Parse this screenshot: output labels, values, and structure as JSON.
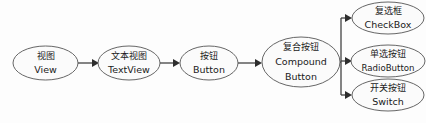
{
  "diagram": {
    "type": "flowchart",
    "background_color": "#fdfdfd",
    "node_fill_color": "#fbfbfb",
    "node_stroke_color": "#555555",
    "edge_color": "#3c3c3c",
    "nodes": [
      {
        "id": "view",
        "label_cn": "视图",
        "label_en": "View",
        "cx": 45.5,
        "cy": 63,
        "rx": 32.5,
        "ry": 17
      },
      {
        "id": "textview",
        "label_cn": "文本视图",
        "label_en": "TextView",
        "cx": 129,
        "cy": 63,
        "rx": 31,
        "ry": 17
      },
      {
        "id": "button",
        "label_cn": "按钮",
        "label_en": "Button",
        "cx": 209,
        "cy": 63,
        "rx": 29,
        "ry": 17
      },
      {
        "id": "compoundbutton",
        "label_cn": "复合按钮",
        "label_en_line1": "Compound",
        "label_en_line2": "Button",
        "cx": 301,
        "cy": 62,
        "rx": 39,
        "ry": 25
      },
      {
        "id": "checkbox",
        "label_cn": "复选框",
        "label_en": "CheckBox",
        "cx": 388,
        "cy": 18,
        "rx": 36,
        "ry": 16
      },
      {
        "id": "radiobutton",
        "label_cn": "单选按钮",
        "label_en": "RadioButton",
        "cx": 388,
        "cy": 61,
        "rx": 37,
        "ry": 16
      },
      {
        "id": "switch",
        "label_cn": "开关按钮",
        "label_en": "Switch",
        "cx": 388,
        "cy": 95,
        "rx": 36,
        "ry": 16
      }
    ],
    "edges": [
      {
        "id": "view-to-textview",
        "from": "view",
        "to": "textview",
        "kind": "straight-arrow"
      },
      {
        "id": "textview-to-button",
        "from": "textview",
        "to": "button",
        "kind": "straight-arrow"
      },
      {
        "id": "button-to-compoundbutton",
        "from": "button",
        "to": "compoundbutton",
        "kind": "straight-arrow"
      },
      {
        "id": "compoundbutton-to-checkbox",
        "from": "compoundbutton",
        "to": "checkbox",
        "kind": "branch-arrow"
      },
      {
        "id": "compoundbutton-to-radiobutton",
        "from": "compoundbutton",
        "to": "radiobutton",
        "kind": "branch-arrow"
      },
      {
        "id": "compoundbutton-to-switch",
        "from": "compoundbutton",
        "to": "switch",
        "kind": "branch-arrow"
      }
    ]
  }
}
